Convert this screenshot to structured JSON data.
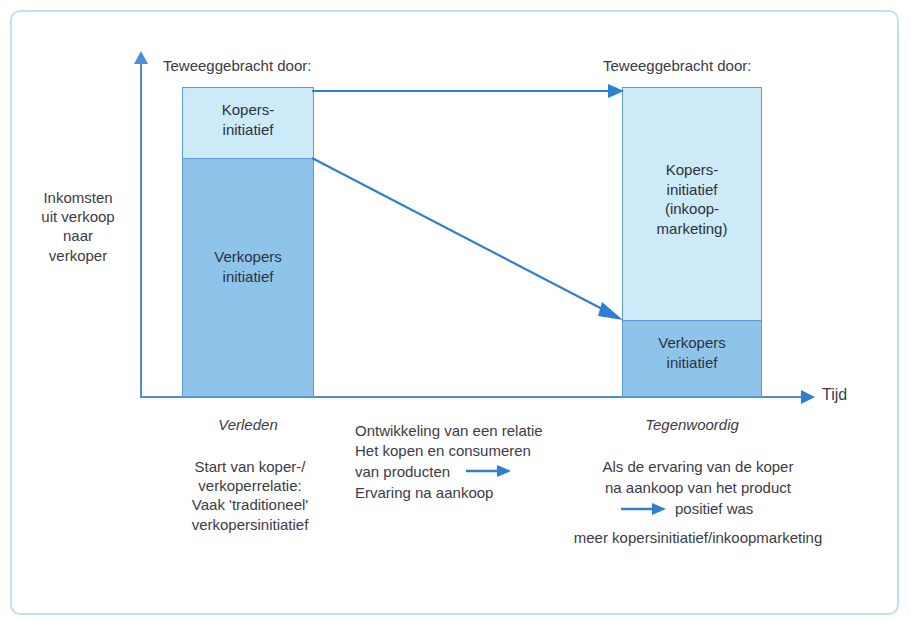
{
  "figure": {
    "accent_color": "#4a90d9",
    "segment_light_color": "#cceaf7",
    "segment_mid_color": "#8fc4ea",
    "frame_color": "#bfe2f2"
  },
  "axes": {
    "y_label": "Inkomsten\nuit verkoop\nnaar\nverkoper",
    "x_label": "Tijd"
  },
  "columns": {
    "left": {
      "header": "Teweeggebracht door:",
      "period": "Verleden",
      "note": "Start van koper-/\nverkoperrelatie:\nVaak 'traditioneel'\nverkopersinitiatief",
      "bar": {
        "top_segment": "Kopers-\ninitiatief",
        "bottom_segment": "Verkopers\ninitiatief"
      }
    },
    "middle": {
      "line1": "Ontwikkeling van een relatie",
      "line2": "Het kopen en consumeren",
      "line3": "van producten",
      "line4": "Ervaring na aankoop"
    },
    "right": {
      "header": "Teweeggebracht door:",
      "period": "Tegenwoordig",
      "note_line1": "Als de ervaring van de koper",
      "note_line2": "na aankoop van het product",
      "note_line3": "positief was",
      "note_line4": "meer kopersinitiatief/inkoopmarketing",
      "bar": {
        "top_segment": "Kopers-\ninitiatief\n(inkoop-\nmarketing)",
        "bottom_segment": "Verkopers\ninitiatief"
      }
    }
  }
}
